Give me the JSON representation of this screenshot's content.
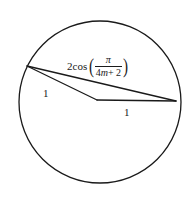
{
  "figure": {
    "name": "circle-with-inscribed-chords",
    "background_color": "#ffffff",
    "stroke_color": "#1a1a1a",
    "circle": {
      "center_x": 100,
      "center_y": 102,
      "radius": 81,
      "stroke_width": 1.3
    },
    "vertices": {
      "left": {
        "x": 27,
        "y": 66
      },
      "bend": {
        "x": 97,
        "y": 100
      },
      "right": {
        "x": 176,
        "y": 101
      }
    },
    "segments": [
      {
        "name": "long-chord",
        "from": "left",
        "to": "right",
        "label": "2cos(pi/(4m+2))"
      },
      {
        "name": "left-side",
        "from": "left",
        "to": "bend",
        "label": "1"
      },
      {
        "name": "right-side",
        "from": "bend",
        "to": "right",
        "label": "1"
      }
    ]
  },
  "labels": {
    "chord_formula": {
      "coefficient": "2",
      "function": "cos",
      "paren_open": "(",
      "paren_close": ")",
      "numerator": "π",
      "denominator_coefficient": "4",
      "denominator_variable": "m",
      "denominator_operator": "+",
      "denominator_constant": "2",
      "full_text": "2cos(π/(4m + 2))"
    },
    "left_side": "1",
    "right_side": "1"
  }
}
